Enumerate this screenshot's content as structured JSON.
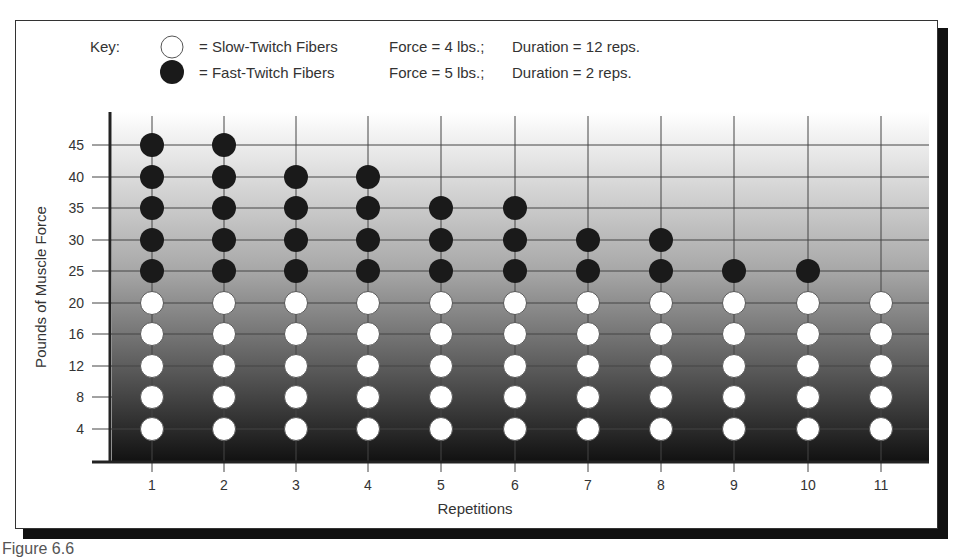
{
  "key": {
    "label": "Key:",
    "slow": {
      "symbol": "white-circle",
      "text": "= Slow-Twitch Fibers",
      "force": "Force = 4 lbs.;",
      "duration": "Duration = 12 reps."
    },
    "fast": {
      "symbol": "black-circle",
      "text": "= Fast-Twitch Fibers",
      "force": "Force = 5 lbs.;",
      "duration": "Duration = 2 reps."
    }
  },
  "caption": "Figure 6.6",
  "colors": {
    "fast": "#1a1a1a",
    "slow": "#ffffff",
    "gradient_top": "#ffffff",
    "gradient_bottom": "#111111",
    "grid": "#444444"
  },
  "chart_data": {
    "type": "scatter",
    "title": "",
    "xlabel": "Repetitions",
    "ylabel": "Pounds of Muscle Force",
    "x_ticks": [
      "1",
      "2",
      "3",
      "4",
      "5",
      "6",
      "7",
      "8",
      "9",
      "10",
      "11"
    ],
    "y_ticks": [
      "4",
      "8",
      "12",
      "16",
      "20",
      "25",
      "30",
      "35",
      "40",
      "45"
    ],
    "grid": true,
    "legend_position": "top",
    "series": [
      {
        "name": "Slow-Twitch Fibers",
        "marker": "white circle",
        "points_per_rep": {
          "1": [
            4,
            8,
            12,
            16,
            20
          ],
          "2": [
            4,
            8,
            12,
            16,
            20
          ],
          "3": [
            4,
            8,
            12,
            16,
            20
          ],
          "4": [
            4,
            8,
            12,
            16,
            20
          ],
          "5": [
            4,
            8,
            12,
            16,
            20
          ],
          "6": [
            4,
            8,
            12,
            16,
            20
          ],
          "7": [
            4,
            8,
            12,
            16,
            20
          ],
          "8": [
            4,
            8,
            12,
            16,
            20
          ],
          "9": [
            4,
            8,
            12,
            16,
            20
          ],
          "10": [
            4,
            8,
            12,
            16,
            20
          ],
          "11": [
            4,
            8,
            12,
            16,
            20
          ]
        }
      },
      {
        "name": "Fast-Twitch Fibers",
        "marker": "black circle",
        "points_per_rep": {
          "1": [
            25,
            30,
            35,
            40,
            45
          ],
          "2": [
            25,
            30,
            35,
            40,
            45
          ],
          "3": [
            25,
            30,
            35,
            40
          ],
          "4": [
            25,
            30,
            35,
            40
          ],
          "5": [
            25,
            30,
            35
          ],
          "6": [
            25,
            30,
            35
          ],
          "7": [
            25,
            30
          ],
          "8": [
            25,
            30
          ],
          "9": [
            25
          ],
          "10": [
            25
          ],
          "11": []
        }
      }
    ],
    "max_force_per_rep": [
      45,
      45,
      40,
      40,
      35,
      35,
      30,
      30,
      25,
      25,
      20
    ]
  }
}
